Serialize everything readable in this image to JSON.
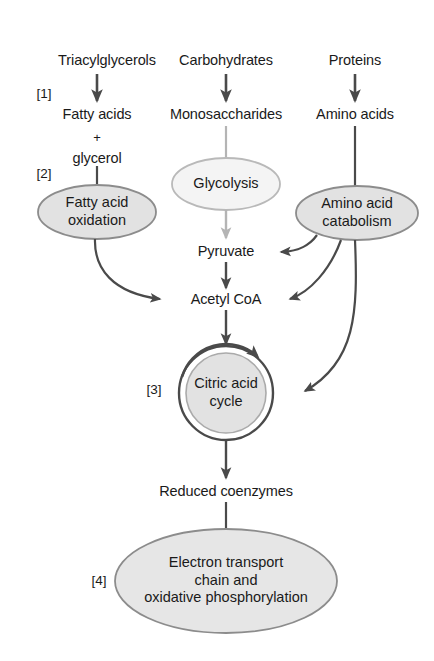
{
  "diagram": {
    "colors": {
      "stroke_dark": "#4a4a4a",
      "stroke_light": "#b4b4b4",
      "fill_gray": "#e2e2e2",
      "fill_light": "#f4f4f4",
      "text": "#1a1a1a",
      "background": "#ffffff"
    },
    "step_tags": [
      {
        "id": "tag-1",
        "label": "[1]"
      },
      {
        "id": "tag-2",
        "label": "[2]"
      },
      {
        "id": "tag-3",
        "label": "[3]"
      },
      {
        "id": "tag-4",
        "label": "[4]"
      }
    ],
    "inputs": [
      {
        "id": "triacylglycerols",
        "label": "Triacylglycerols"
      },
      {
        "id": "carbohydrates",
        "label": "Carbohydrates"
      },
      {
        "id": "proteins",
        "label": "Proteins"
      }
    ],
    "monomers": [
      {
        "id": "fatty-acids",
        "label": "Fatty acids"
      },
      {
        "id": "plus",
        "label": "+"
      },
      {
        "id": "glycerol",
        "label": "glycerol"
      },
      {
        "id": "monosaccharides",
        "label": "Monosaccharides"
      },
      {
        "id": "amino-acids",
        "label": "Amino acids"
      }
    ],
    "pathways": [
      {
        "id": "fatty-acid-oxidation",
        "line1": "Fatty acid",
        "line2": "oxidation"
      },
      {
        "id": "glycolysis",
        "line1": "Glycolysis",
        "line2": ""
      },
      {
        "id": "amino-acid-catabolism",
        "line1": "Amino acid",
        "line2": "catabolism"
      }
    ],
    "intermediates": [
      {
        "id": "pyruvate",
        "label": "Pyruvate"
      },
      {
        "id": "acetyl-coa",
        "label": "Acetyl CoA"
      },
      {
        "id": "reduced-coenzymes",
        "label": "Reduced coenzymes"
      }
    ],
    "cycle": {
      "id": "citric-acid-cycle",
      "line1": "Citric acid",
      "line2": "cycle"
    },
    "final_stage": {
      "id": "electron-transport-chain",
      "line1": "Electron transport",
      "line2": "chain and",
      "line3": "oxidative phosphorylation"
    }
  }
}
